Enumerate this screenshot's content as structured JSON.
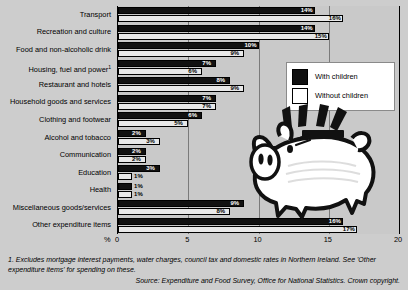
{
  "chart_data": {
    "type": "bar",
    "orientation": "horizontal",
    "title": "",
    "xlabel": "%",
    "ylabel": "",
    "xlim": [
      0,
      20
    ],
    "xticks": [
      "0",
      "5",
      "10",
      "15",
      "20"
    ],
    "grid": true,
    "legend_position": "top-right",
    "categories": [
      "Transport",
      "Recreation and culture",
      "Food and non-alcoholic drink",
      "Housing, fuel and power",
      "Restaurant and hotels",
      "Household goods and services",
      "Clothing and footwear",
      "Alcohol and tobacco",
      "Communication",
      "Education",
      "Health",
      "Miscellaneous goods/services",
      "Other expenditure items"
    ],
    "category_footnote_marker": {
      "Housing, fuel and power": "1"
    },
    "series": [
      {
        "name": "With children",
        "color": "#111111",
        "values": [
          14,
          14,
          10,
          7,
          8,
          7,
          6,
          2,
          2,
          3,
          1,
          9,
          16
        ],
        "labels": [
          "14%",
          "14%",
          "10%",
          "7%",
          "8%",
          "7%",
          "6%",
          "2%",
          "2%",
          "3%",
          "1%",
          "9%",
          "16%"
        ]
      },
      {
        "name": "Without children",
        "color": "#e8e8e8",
        "values": [
          16,
          15,
          9,
          6,
          9,
          7,
          5,
          3,
          2,
          1,
          1,
          8,
          17
        ],
        "labels": [
          "16%",
          "15%",
          "9%",
          "6%",
          "9%",
          "7%",
          "5%",
          "3%",
          "2%",
          "1%",
          "1%",
          "8%",
          "17%"
        ]
      }
    ]
  },
  "legend": {
    "items": [
      {
        "label": "With children",
        "swatch": "dark"
      },
      {
        "label": "Without children",
        "swatch": "light"
      }
    ]
  },
  "axis": {
    "unit": "%",
    "ticks": [
      "0",
      "5",
      "10",
      "15",
      "20"
    ]
  },
  "notes": {
    "footnote": "1. Excludes mortgage interest payments, water charges, council tax and domestic rates in Northern Ireland. See 'Other expenditure items' for spending on these.",
    "source": "Source: Expenditure and Food Survey, Office for National Statistics. Crown copyright."
  },
  "graphic": {
    "name": "piggy-bank-illustration"
  }
}
